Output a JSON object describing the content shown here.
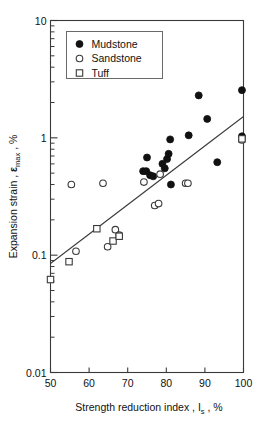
{
  "chart_data": {
    "type": "scatter",
    "title": "",
    "xlabel": "Strength reduction index , Is , %",
    "xlabel_parts": {
      "main": "Strength reduction  index , ",
      "symbol": "I",
      "sub": "s",
      "tail": " , %"
    },
    "ylabel": "Expansion strain , εmax , %",
    "ylabel_parts": {
      "main": "Expansion strain , ",
      "symbol": "ε",
      "sub": "max",
      "tail": " , %"
    },
    "xlim": [
      50,
      100
    ],
    "ylim": [
      0.01,
      10
    ],
    "yscale": "log",
    "xscale": "linear",
    "grid": false,
    "xticks": [
      50,
      60,
      70,
      80,
      90,
      100
    ],
    "xtick_labels": [
      "50",
      "60",
      "70",
      "80",
      "90",
      "100"
    ],
    "yticks": [
      0.01,
      0.1,
      1,
      10
    ],
    "ytick_labels": [
      "0.01",
      "0.1",
      "1",
      "10"
    ],
    "y_minor_ticks": [
      0.02,
      0.03,
      0.04,
      0.05,
      0.06,
      0.07,
      0.08,
      0.09,
      0.2,
      0.3,
      0.4,
      0.5,
      0.6,
      0.7,
      0.8,
      0.9,
      2,
      3,
      4,
      5,
      6,
      7,
      8,
      9
    ],
    "legend_position": "top-left",
    "legend": [
      {
        "label": "Mudstone",
        "marker": "filled-circle"
      },
      {
        "label": "Sandstone",
        "marker": "open-circle"
      },
      {
        "label": "Tuff",
        "marker": "open-square"
      }
    ],
    "series": [
      {
        "name": "Mudstone",
        "marker": "filled-circle",
        "points": [
          [
            74.0,
            0.52
          ],
          [
            74.8,
            0.52
          ],
          [
            75.0,
            0.68
          ],
          [
            75.8,
            0.48
          ],
          [
            76.6,
            0.47
          ],
          [
            79.0,
            0.6
          ],
          [
            79.6,
            0.55
          ],
          [
            80.2,
            0.66
          ],
          [
            80.6,
            0.73
          ],
          [
            81.0,
            0.97
          ],
          [
            81.2,
            0.4
          ],
          [
            85.8,
            1.05
          ],
          [
            88.4,
            2.3
          ],
          [
            90.6,
            1.45
          ],
          [
            93.2,
            0.62
          ],
          [
            99.6,
            2.55
          ],
          [
            99.6,
            1.03
          ]
        ]
      },
      {
        "name": "Sandstone",
        "marker": "open-circle",
        "points": [
          [
            55.4,
            0.4
          ],
          [
            56.6,
            0.108
          ],
          [
            63.6,
            0.41
          ],
          [
            64.8,
            0.118
          ],
          [
            66.8,
            0.165
          ],
          [
            67.8,
            0.148
          ],
          [
            74.2,
            0.42
          ],
          [
            77.0,
            0.265
          ],
          [
            78.0,
            0.275
          ],
          [
            78.4,
            0.49
          ],
          [
            85.0,
            0.41
          ],
          [
            85.6,
            0.41
          ],
          [
            99.6,
            0.96
          ]
        ]
      },
      {
        "name": "Tuff",
        "marker": "open-square",
        "points": [
          [
            50.0,
            0.062
          ],
          [
            54.8,
            0.088
          ],
          [
            62.0,
            0.168
          ],
          [
            66.2,
            0.132
          ],
          [
            67.8,
            0.145
          ],
          [
            99.6,
            0.98
          ]
        ]
      }
    ],
    "trend_line": {
      "name": "regression-line",
      "x_start": 50.0,
      "y_start": 0.085,
      "x_end": 100.0,
      "y_end": 1.52
    }
  }
}
